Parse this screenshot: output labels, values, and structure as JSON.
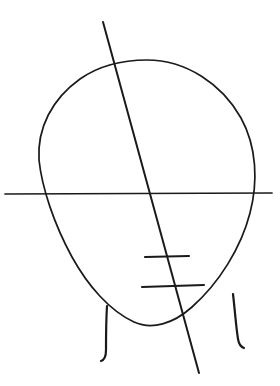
{
  "canvas": {
    "width": 280,
    "height": 386,
    "background_color": "#ffffff",
    "ink_color": "#1a1a1a",
    "medium": "pencil-sketch",
    "subject": "head-construction-diagram"
  },
  "chart_data": {
    "type": "diagram",
    "title": "",
    "subtitle": "",
    "xlabel": "",
    "ylabel": "",
    "grid": false,
    "legend": null,
    "axis_ranges": {
      "x": [
        0,
        280
      ],
      "y": [
        0,
        386
      ]
    },
    "annotations": [],
    "shapes": [
      {
        "name": "head-oval",
        "type": "closed-curve",
        "description": "egg-shaped head outline, wide cranium, tapering jaw",
        "path": "M 147,60 C 186,60 222,84 241,118 C 257,147 258,182 250,213 C 241,248 219,283 192,307 C 173,324 152,330 134,322 C 110,311 88,286 72,257 C 54,224 42,188 39,160 C 37,128 52,99 80,79 C 100,65 123,60 147,60 Z",
        "stroke_width": 1.7,
        "extents": {
          "top": 60,
          "bottom": 327,
          "left": 39,
          "right": 255
        }
      },
      {
        "name": "eye-line-horizontal",
        "type": "line",
        "description": "horizontal construction line through the eye level, extends past the oval on both sides",
        "x1": 5,
        "y1": 194,
        "x2": 272,
        "y2": 193,
        "stroke_width": 1.7
      },
      {
        "name": "center-tilt-axis-diagonal",
        "type": "line",
        "description": "diagonal centerline showing head tilt, from upper-left above the crown to lower-right below the chin",
        "x1": 103,
        "y1": 22,
        "x2": 199,
        "y2": 373,
        "stroke_width": 2.0
      },
      {
        "name": "nose-guide-line",
        "type": "line",
        "description": "short horizontal guide mark for the nose base",
        "x1": 145,
        "y1": 257,
        "x2": 189,
        "y2": 256,
        "stroke_width": 2.1
      },
      {
        "name": "mouth-guide-line",
        "type": "line",
        "description": "short horizontal guide mark for the mouth line, slightly longer than the nose mark",
        "x1": 142,
        "y1": 287,
        "x2": 204,
        "y2": 285,
        "stroke_width": 2.1
      },
      {
        "name": "neck-line-left",
        "type": "curve",
        "description": "left side of the neck, curving down and hooking slightly left at the base",
        "path": "M 107,306 C 106,322 106,339 106,350 C 106,357 104,360 101,361",
        "stroke_width": 2.2
      },
      {
        "name": "neck-line-right",
        "type": "curve",
        "description": "right side of the neck, curving down and flaring slightly right at the base",
        "path": "M 233,294 C 235,311 236,327 238,339 C 239,345 241,347 244,348",
        "stroke_width": 2.2
      }
    ],
    "intersections": [
      {
        "name": "diagonal-crosses-eye-line",
        "x": 149,
        "y": 194
      },
      {
        "name": "diagonal-crosses-crown",
        "x": 113,
        "y": 63
      },
      {
        "name": "diagonal-crosses-jaw",
        "x": 185,
        "y": 318
      },
      {
        "name": "eye-line-meets-oval-left",
        "x": 41,
        "y": 193
      },
      {
        "name": "eye-line-meets-oval-right",
        "x": 253,
        "y": 193
      }
    ]
  }
}
